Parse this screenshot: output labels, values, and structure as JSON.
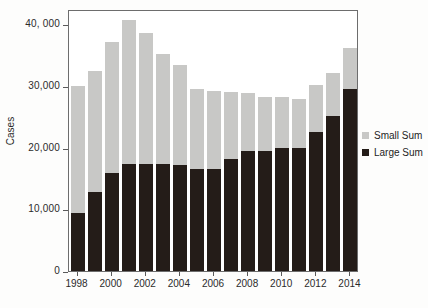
{
  "chart_data": {
    "type": "bar",
    "subtype": "stacked-bar",
    "title": "",
    "xlabel": "",
    "ylabel": "Cases",
    "categories": [
      1998,
      1999,
      2000,
      2001,
      2002,
      2003,
      2004,
      2005,
      2006,
      2007,
      2008,
      2009,
      2010,
      2011,
      2012,
      2013,
      2014
    ],
    "series": [
      {
        "name": "Large Sum",
        "color": "#241c18",
        "values": [
          9400,
          12800,
          15900,
          17400,
          17300,
          17300,
          17200,
          16600,
          16500,
          18100,
          19400,
          19500,
          19900,
          19900,
          22500,
          25100,
          29500
        ]
      },
      {
        "name": "Small Sum",
        "color": "#c8c8c6",
        "values": [
          20600,
          19700,
          21200,
          23300,
          21300,
          17900,
          16200,
          13000,
          12700,
          10900,
          9500,
          8700,
          8400,
          8000,
          7600,
          7100,
          6700
        ]
      }
    ],
    "totals": [
      30000,
      32500,
      37100,
      40700,
      38600,
      35200,
      33400,
      29600,
      29200,
      29000,
      28900,
      28200,
      28300,
      27900,
      30100,
      32200,
      36200
    ],
    "ylim": [
      0,
      42500
    ],
    "yticks": [
      0,
      10000,
      20000,
      30000,
      40000
    ],
    "ytick_labels": [
      "0",
      "10,000",
      "20,000",
      "30,000",
      "40, 000"
    ],
    "xticks": [
      1998,
      2000,
      2002,
      2004,
      2006,
      2008,
      2010,
      2012,
      2014
    ],
    "xtick_labels": [
      "1998",
      "2000",
      "2002",
      "2004",
      "2006",
      "2008",
      "2010",
      "2012",
      "2014"
    ],
    "grid": false,
    "legend_position": "right"
  },
  "axes": {
    "y_title": "Cases"
  },
  "legend": {
    "entries": [
      {
        "label": "Small Sum",
        "color": "#c8c8c6",
        "swatch": "legend-swatch-small-sum"
      },
      {
        "label": "Large Sum",
        "color": "#241c18",
        "swatch": "legend-swatch-large-sum"
      }
    ]
  },
  "caption": {
    "text": ""
  }
}
